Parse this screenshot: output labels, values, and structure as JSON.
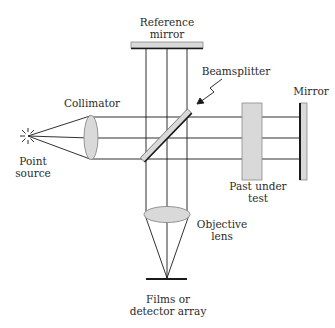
{
  "diagram": {
    "type": "optical interferometer schematic",
    "labels": {
      "reference_mirror": [
        "Reference",
        "mirror"
      ],
      "beamsplitter": "Beamsplitter",
      "mirror": "Mirror",
      "collimator": "Collimator",
      "point_source": [
        "Point",
        "source"
      ],
      "part_under_test": [
        "Past under",
        "test"
      ],
      "objective_lens": [
        "Objective",
        "lens"
      ],
      "detector": [
        "Films or",
        "detector array"
      ]
    },
    "colors": {
      "line": "#1a1a1a",
      "component_fill": "#d9d9d9",
      "component_stroke": "#8a8a8a",
      "text": "#2a2a2a",
      "background": "#ffffff"
    },
    "components": [
      {
        "id": "point-source",
        "kind": "star"
      },
      {
        "id": "collimator",
        "kind": "lens"
      },
      {
        "id": "beamsplitter",
        "kind": "plate-45deg"
      },
      {
        "id": "reference-mirror",
        "kind": "mirror"
      },
      {
        "id": "part-under-test",
        "kind": "sample"
      },
      {
        "id": "mirror",
        "kind": "mirror"
      },
      {
        "id": "objective-lens",
        "kind": "lens"
      },
      {
        "id": "detector",
        "kind": "sensor"
      }
    ]
  }
}
